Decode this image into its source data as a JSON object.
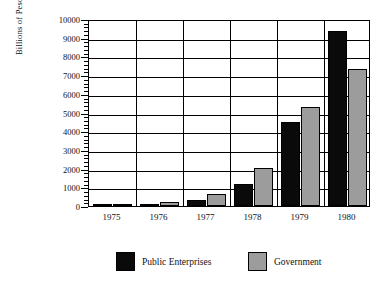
{
  "chart_data": {
    "type": "bar",
    "title": "",
    "subtitle": "",
    "xlabel": "",
    "ylabel": "Billions of Pesos",
    "categories": [
      "1975",
      "1976",
      "1977",
      "1978",
      "1979",
      "1980"
    ],
    "series": [
      {
        "name": "Public Enterprises",
        "color": "#0a0a0a",
        "values": [
          50,
          130,
          320,
          1200,
          4500,
          9350
        ]
      },
      {
        "name": "Government",
        "color": "#9c9c9c",
        "values": [
          60,
          200,
          650,
          2050,
          5300,
          7350
        ]
      }
    ],
    "ylim": [
      0,
      10000
    ],
    "ytick_labels": [
      "0",
      "1000",
      "2000",
      "3000",
      "4000",
      "5000",
      "6000",
      "7000",
      "8000",
      "9000",
      "10000"
    ],
    "ytick_values": [
      0,
      1000,
      2000,
      3000,
      4000,
      5000,
      6000,
      7000,
      8000,
      9000,
      10000
    ],
    "minor_tick_step": 200,
    "grid": true,
    "legend_position": "bottom",
    "legend": [
      {
        "label": "Public Enterprises",
        "color": "#0a0a0a"
      },
      {
        "label": "Government",
        "color": "#9c9c9c"
      }
    ]
  }
}
